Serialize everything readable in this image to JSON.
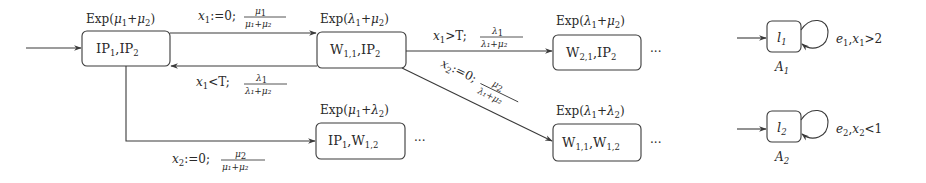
{
  "states": [
    {
      "id": "s0",
      "label": "IP",
      "label_parts": [
        [
          "IP",
          "1"
        ],
        [
          ",IP",
          "2"
        ]
      ],
      "rate": "Exp(μ1+μ2)",
      "initial": true
    },
    {
      "id": "s1",
      "label_parts": [
        [
          "W",
          "1,1"
        ],
        [
          ",IP",
          "2"
        ]
      ],
      "rate": "Exp(λ1+μ2)"
    },
    {
      "id": "s2",
      "label_parts": [
        [
          "W",
          "2,1"
        ],
        [
          ",IP",
          "2"
        ]
      ],
      "rate": "Exp(λ1+μ2)",
      "continues": "···"
    },
    {
      "id": "s3",
      "label_parts": [
        [
          "IP",
          "1"
        ],
        [
          ",W",
          "1,2"
        ]
      ],
      "rate": "Exp(μ1+λ2)",
      "continues": "···"
    },
    {
      "id": "s4",
      "label_parts": [
        [
          "W",
          "1,1"
        ],
        [
          ",W",
          "1,2"
        ]
      ],
      "rate": "Exp(λ1+λ2)",
      "continues": "···"
    }
  ],
  "node_text": {
    "s0": {
      "a": "IP",
      "as": "1",
      "b": ",IP",
      "bs": "2"
    },
    "s1": {
      "a": "W",
      "as": "1,1",
      "b": ",IP",
      "bs": "2"
    },
    "s2": {
      "a": "W",
      "as": "2,1",
      "b": ",IP",
      "bs": "2"
    },
    "s3": {
      "a": "IP",
      "as": "1",
      "b": ",W",
      "bs": "1,2"
    },
    "s4": {
      "a": "W",
      "as": "1,1",
      "b": ",W",
      "bs": "1,2"
    }
  },
  "rates": {
    "s0": {
      "pre": "Exp(",
      "v1": "μ",
      "s1": "1",
      "op": "+",
      "v2": "μ",
      "s2": "2",
      "post": ")"
    },
    "s1": {
      "pre": "Exp(",
      "v1": "λ",
      "s1": "1",
      "op": "+",
      "v2": "μ",
      "s2": "2",
      "post": ")"
    },
    "s2": {
      "pre": "Exp(",
      "v1": "λ",
      "s1": "1",
      "op": "+",
      "v2": "μ",
      "s2": "2",
      "post": ")"
    },
    "s3": {
      "pre": "Exp(",
      "v1": "μ",
      "s1": "1",
      "op": "+",
      "v2": "λ",
      "s2": "2",
      "post": ")"
    },
    "s4": {
      "pre": "Exp(",
      "v1": "λ",
      "s1": "1",
      "op": "+",
      "v2": "λ",
      "s2": "2",
      "post": ")"
    }
  },
  "edges": {
    "s0_s1": {
      "guard_var": "x",
      "guard_sub": "1",
      "guard_rest": ":=0;",
      "num": "μ",
      "num_sub": "1",
      "den": "μ₁+μ₂"
    },
    "s1_s0": {
      "guard_var": "x",
      "guard_sub": "1",
      "guard_rest": "<T;",
      "num": "λ",
      "num_sub": "1",
      "den": "λ₁+μ₂"
    },
    "s1_s2": {
      "guard_var": "x",
      "guard_sub": "1",
      "guard_rest": ">T;",
      "num": "λ",
      "num_sub": "1",
      "den": "λ₁+μ₂"
    },
    "s1_s4": {
      "guard_var": "x",
      "guard_sub": "2",
      "guard_rest": ":=0;",
      "num": "μ",
      "num_sub": "2",
      "den": "λ₁+μ₂"
    },
    "s0_s3": {
      "guard_var": "x",
      "guard_sub": "2",
      "guard_rest": ":=0;",
      "num": "μ",
      "num_sub": "2",
      "den": "μ₁+μ₂"
    }
  },
  "ellipsis": "···",
  "automata": [
    {
      "name": "A",
      "name_sub": "1",
      "location": "l",
      "location_sub": "1",
      "loop_label": "e₁,x₁>2",
      "edge": "e",
      "edge_sub": "1",
      "guard_var": "x",
      "guard_sub": "1",
      "guard_rest": ">2"
    },
    {
      "name": "A",
      "name_sub": "2",
      "location": "l",
      "location_sub": "2",
      "loop_label": "e₂,x₂<1",
      "edge": "e",
      "edge_sub": "2",
      "guard_var": "x",
      "guard_sub": "2",
      "guard_rest": "<1"
    }
  ]
}
